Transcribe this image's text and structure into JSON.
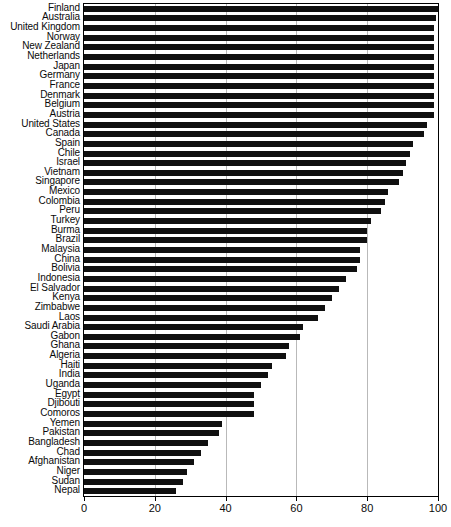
{
  "chart_data": {
    "type": "bar",
    "orientation": "horizontal",
    "title": "",
    "xlabel": "",
    "ylabel": "",
    "xlim": [
      0,
      100
    ],
    "xticks": [
      0,
      20,
      40,
      60,
      80,
      100
    ],
    "grid": true,
    "grid_axis": "x",
    "legend": false,
    "bar_color": "#101010",
    "grid_color": "#b9b9b9",
    "axis_color": "#000000",
    "categories": [
      "Finland",
      "Australia",
      "United Kingdom",
      "Norway",
      "New Zealand",
      "Netherlands",
      "Japan",
      "Germany",
      "France",
      "Denmark",
      "Belgium",
      "Austria",
      "United States",
      "Canada",
      "Spain",
      "Chile",
      "Israel",
      "Vietnam",
      "Singapore",
      "Mexico",
      "Colombia",
      "Peru",
      "Turkey",
      "Burma",
      "Brazil",
      "Malaysia",
      "China",
      "Bolivia",
      "Indonesia",
      "El Salvador",
      "Kenya",
      "Zimbabwe",
      "Laos",
      "Saudi Arabia",
      "Gabon",
      "Ghana",
      "Algeria",
      "Haiti",
      "India",
      "Uganda",
      "Egypt",
      "Djibouti",
      "Comoros",
      "Yemen",
      "Pakistan",
      "Bangladesh",
      "Chad",
      "Afghanistan",
      "Niger",
      "Sudan",
      "Nepal"
    ],
    "values": [
      100,
      99.5,
      99,
      99,
      99,
      99,
      99,
      99,
      99,
      99,
      99,
      99,
      97,
      96,
      93,
      92,
      91,
      90,
      89,
      86,
      85,
      84,
      81,
      80,
      80,
      78,
      78,
      77,
      74,
      72,
      70,
      68,
      66,
      62,
      61,
      58,
      57,
      53,
      52,
      50,
      48,
      48,
      48,
      39,
      38,
      35,
      33,
      31,
      29,
      28,
      26
    ]
  }
}
